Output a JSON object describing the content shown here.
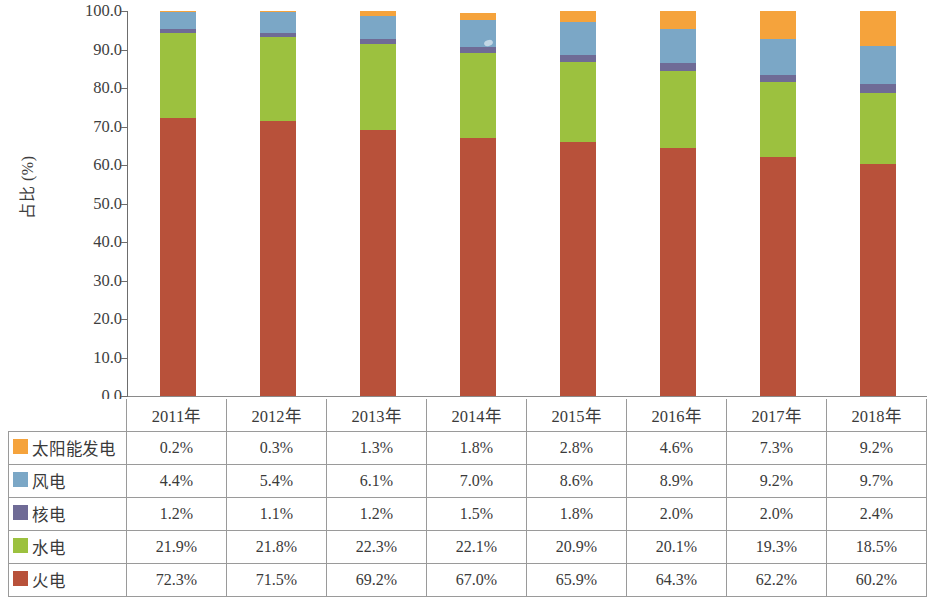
{
  "chart_data": {
    "type": "bar",
    "stacked": true,
    "title": "",
    "xlabel": "",
    "ylabel": "占比 (%)",
    "ylim": [
      0,
      100
    ],
    "ytick_step": 10,
    "ytick_labels": [
      "100.0",
      "90.0",
      "80.0",
      "70.0",
      "60.0",
      "50.0",
      "40.0",
      "30.0",
      "20.0",
      "10.0",
      "0.0"
    ],
    "categories": [
      "2011年",
      "2012年",
      "2013年",
      "2014年",
      "2015年",
      "2016年",
      "2017年",
      "2018年"
    ],
    "grid": false,
    "legend_position": "table-row-headers",
    "series": [
      {
        "name": "太阳能发电",
        "color": "#F5A33C",
        "values": [
          0.2,
          0.3,
          1.3,
          1.8,
          2.8,
          4.6,
          7.3,
          9.2
        ],
        "labels": [
          "0.2%",
          "0.3%",
          "1.3%",
          "1.8%",
          "2.8%",
          "4.6%",
          "7.3%",
          "9.2%"
        ]
      },
      {
        "name": "风电",
        "color": "#7BA7C6",
        "values": [
          4.4,
          5.4,
          6.1,
          7.0,
          8.6,
          8.9,
          9.2,
          9.7
        ],
        "labels": [
          "4.4%",
          "5.4%",
          "6.1%",
          "7.0%",
          "8.6%",
          "8.9%",
          "9.2%",
          "9.7%"
        ]
      },
      {
        "name": "核电",
        "color": "#6F6B96",
        "values": [
          1.2,
          1.1,
          1.2,
          1.5,
          1.8,
          2.0,
          2.0,
          2.4
        ],
        "labels": [
          "1.2%",
          "1.1%",
          "1.2%",
          "1.5%",
          "1.8%",
          "2.0%",
          "2.0%",
          "2.4%"
        ]
      },
      {
        "name": "水电",
        "color": "#9CC13F",
        "values": [
          21.9,
          21.8,
          22.3,
          22.1,
          20.9,
          20.1,
          19.3,
          18.5
        ],
        "labels": [
          "21.9%",
          "21.8%",
          "22.3%",
          "22.1%",
          "20.9%",
          "20.1%",
          "19.3%",
          "18.5%"
        ]
      },
      {
        "name": "火电",
        "color": "#B8513A",
        "values": [
          72.3,
          71.5,
          69.2,
          67.0,
          65.9,
          64.3,
          62.2,
          60.2
        ],
        "labels": [
          "72.3%",
          "71.5%",
          "69.2%",
          "67.0%",
          "65.9%",
          "64.3%",
          "62.2%",
          "60.2%"
        ]
      }
    ]
  },
  "table": {
    "corner_label": "",
    "column_headers": [
      "2011年",
      "2012年",
      "2013年",
      "2014年",
      "2015年",
      "2016年",
      "2017年",
      "2018年"
    ],
    "rows": [
      {
        "label": "太阳能发电",
        "swatch_color": "#F5A33C",
        "cells": [
          "0.2%",
          "0.3%",
          "1.3%",
          "1.8%",
          "2.8%",
          "4.6%",
          "7.3%",
          "9.2%"
        ]
      },
      {
        "label": "风电",
        "swatch_color": "#7BA7C6",
        "cells": [
          "4.4%",
          "5.4%",
          "6.1%",
          "7.0%",
          "8.6%",
          "8.9%",
          "9.2%",
          "9.7%"
        ]
      },
      {
        "label": "核电",
        "swatch_color": "#6F6B96",
        "cells": [
          "1.2%",
          "1.1%",
          "1.2%",
          "1.5%",
          "1.8%",
          "2.0%",
          "2.0%",
          "2.4%"
        ]
      },
      {
        "label": "水电",
        "swatch_color": "#9CC13F",
        "cells": [
          "21.9%",
          "21.8%",
          "22.3%",
          "22.1%",
          "20.9%",
          "20.1%",
          "19.3%",
          "18.5%"
        ]
      },
      {
        "label": "火电",
        "swatch_color": "#B8513A",
        "cells": [
          "72.3%",
          "71.5%",
          "69.2%",
          "67.0%",
          "65.9%",
          "64.3%",
          "62.2%",
          "60.2%"
        ]
      }
    ]
  },
  "colors": {
    "solar": "#F5A33C",
    "wind": "#7BA7C6",
    "nuclear": "#6F6B96",
    "hydro": "#9CC13F",
    "thermal": "#B8513A",
    "axis": "#6d6d6d",
    "text": "#3a3a3a",
    "table_border": "#9a9a9a",
    "background": "#ffffff"
  }
}
